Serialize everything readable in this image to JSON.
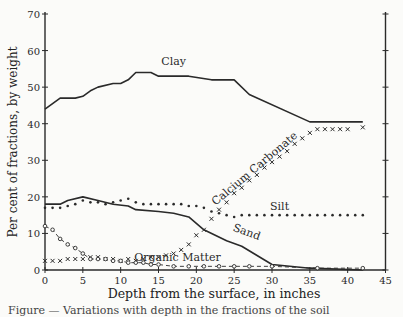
{
  "chart_data": {
    "type": "line",
    "title": "",
    "xlabel": "Depth from the surface, in inches",
    "ylabel": "Per cent of fractions, by weight",
    "xlim": [
      0,
      45
    ],
    "ylim": [
      0,
      70
    ],
    "xticks": [
      0,
      5,
      10,
      15,
      20,
      25,
      30,
      35,
      40,
      45
    ],
    "yticks": [
      0,
      10,
      20,
      30,
      40,
      50,
      60,
      70
    ],
    "grid": false,
    "legend": "inline labels",
    "series": [
      {
        "name": "Clay",
        "style": "solid",
        "x": [
          0,
          2,
          4,
          5,
          6,
          7,
          9,
          10,
          11,
          12,
          14,
          15,
          18,
          19,
          22,
          25,
          27,
          35,
          42
        ],
        "y": [
          44,
          47,
          47,
          47.5,
          49,
          50,
          51,
          51,
          52,
          54,
          54,
          53,
          53,
          53,
          52,
          52,
          48,
          40.5,
          40.5
        ]
      },
      {
        "name": "Silt",
        "style": "dotted",
        "x": [
          0,
          1,
          2,
          3,
          4,
          5,
          6,
          7,
          8,
          9,
          10,
          11,
          12,
          13,
          14,
          15,
          16,
          17,
          18,
          19,
          20,
          21,
          22,
          23,
          24,
          25,
          26,
          28,
          30,
          32,
          34,
          36,
          38,
          40,
          42
        ],
        "y": [
          17,
          17,
          17,
          17.5,
          18,
          19,
          18.5,
          18.5,
          18,
          18.5,
          19,
          19.5,
          18.5,
          18,
          18,
          18,
          18,
          18,
          18,
          17.5,
          17.5,
          17,
          16,
          15.5,
          15,
          14.5,
          15,
          15,
          15,
          15,
          15,
          15,
          15,
          15,
          15
        ]
      },
      {
        "name": "Sand",
        "style": "solid",
        "x": [
          0,
          2,
          3,
          5,
          7,
          9,
          11,
          12,
          15,
          17,
          19,
          21,
          24,
          26,
          30,
          35,
          42
        ],
        "y": [
          18,
          18,
          19,
          20,
          19,
          18,
          17.5,
          16.5,
          16,
          15.5,
          14.5,
          11,
          8,
          6.5,
          1.5,
          0.5,
          0
        ]
      },
      {
        "name": "Calcium Carbonate",
        "style": "x-markers",
        "x": [
          0,
          1,
          2,
          3,
          4,
          5,
          6,
          7,
          8,
          9,
          10,
          11,
          12,
          13,
          14,
          15,
          16,
          17,
          18,
          19,
          20,
          21,
          22,
          23,
          24,
          25,
          26,
          27,
          28,
          29,
          30,
          31,
          32,
          33,
          34,
          35,
          36,
          37,
          38,
          39,
          40,
          42
        ],
        "y": [
          2.5,
          2.5,
          2.5,
          3,
          3,
          3,
          3.5,
          3.5,
          3,
          3,
          2.5,
          3,
          2.5,
          3,
          3.5,
          3.5,
          4,
          4.5,
          5.5,
          7,
          9.5,
          11,
          14,
          16.5,
          18.5,
          21,
          22.5,
          24.5,
          26,
          28,
          29.5,
          31,
          32.5,
          34.5,
          36,
          37.5,
          38.5,
          38.5,
          38.5,
          38.5,
          38.5,
          39
        ]
      },
      {
        "name": "Organic Matter",
        "style": "circle-markers dash",
        "x": [
          0,
          1,
          2,
          3,
          4,
          5,
          6,
          7,
          8,
          9,
          10,
          11,
          12,
          13,
          14,
          15,
          17,
          19,
          21,
          23,
          25,
          27,
          30,
          36,
          42
        ],
        "y": [
          12,
          11,
          8.5,
          7,
          6,
          4.5,
          3,
          3,
          3,
          2.5,
          2.5,
          2,
          2,
          2,
          1.5,
          1.5,
          1,
          1,
          1,
          1,
          1,
          1,
          1,
          0.5,
          0.5
        ]
      }
    ],
    "annotations": [
      {
        "text": "Clay",
        "x": 17,
        "y": 56
      },
      {
        "text": "Silt",
        "x": 31,
        "y": 16.5
      },
      {
        "text": "Sand",
        "x": 26.5,
        "y": 9.5
      },
      {
        "text": "Calcium Carbonate",
        "x": 28,
        "y": 27,
        "rotation": -40
      },
      {
        "text": "Organic Matter",
        "x": 17.5,
        "y": 2.5
      }
    ]
  },
  "caption": "Figure — Variations with depth in the fractions of the soil"
}
